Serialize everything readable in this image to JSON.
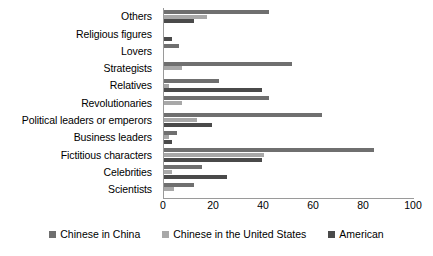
{
  "chart_data": {
    "type": "bar",
    "orientation": "horizontal",
    "title": "",
    "subtitle": "",
    "xlabel": "",
    "ylabel": "",
    "xlim": [
      0,
      100
    ],
    "xticks": [
      0,
      20,
      40,
      60,
      80,
      100
    ],
    "grid": false,
    "legend_position": "bottom",
    "categories": [
      "Others",
      "Religious figures",
      "Lovers",
      "Strategists",
      "Relatives",
      "Revolutionaries",
      "Political leaders or emperors",
      "Business leaders",
      "Fictitious characters",
      "Celebrities",
      "Scientists"
    ],
    "series": [
      {
        "name": "Chinese in China",
        "color": "#6f6f6f",
        "values": [
          42,
          0,
          6,
          51,
          22,
          42,
          63,
          5,
          84,
          15,
          12
        ]
      },
      {
        "name": "Chinese in the United States",
        "color": "#a8a8a8",
        "values": [
          17,
          0,
          0,
          7,
          2,
          7,
          13,
          2,
          40,
          3,
          4
        ]
      },
      {
        "name": "American",
        "color": "#4a4a4a",
        "values": [
          12,
          3,
          0,
          0,
          39,
          0,
          19,
          3,
          39,
          25,
          0
        ]
      }
    ]
  },
  "axis": {
    "tick_labels": [
      "0",
      "20",
      "40",
      "60",
      "80",
      "100"
    ]
  },
  "legend": {
    "items": [
      {
        "label": "Chinese in China",
        "color": "#6f6f6f",
        "icon": "square-swatch-icon"
      },
      {
        "label": "Chinese in the United States",
        "color": "#a8a8a8",
        "icon": "square-swatch-icon"
      },
      {
        "label": "American",
        "color": "#4a4a4a",
        "icon": "square-swatch-icon"
      }
    ]
  }
}
